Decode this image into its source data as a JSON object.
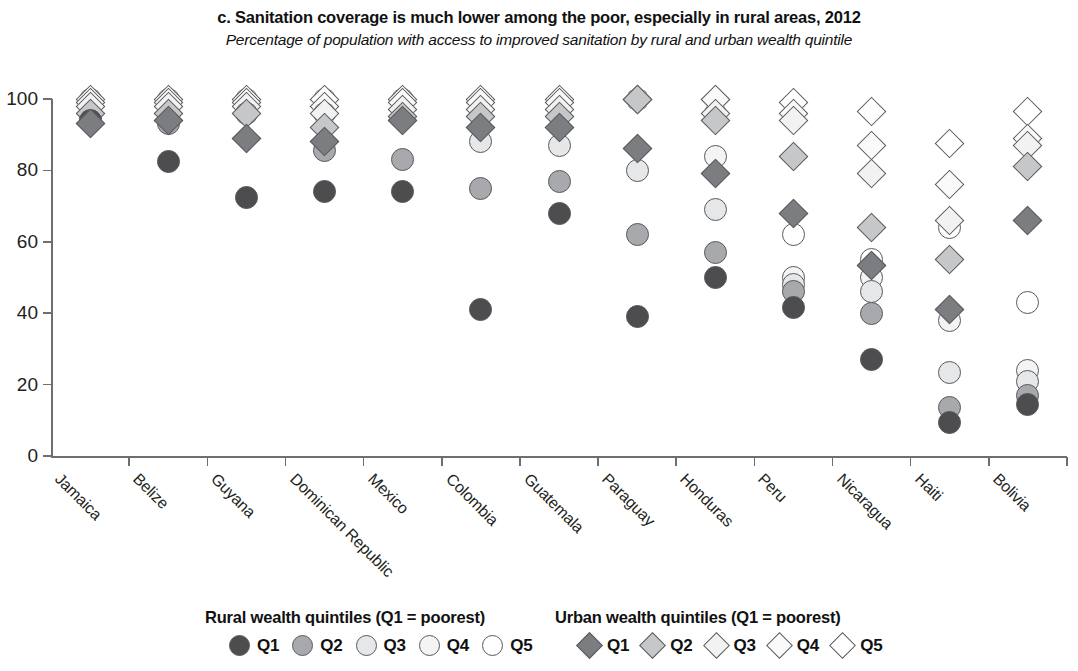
{
  "header": {
    "title": "c. Sanitation coverage is much lower among the poor, especially in rural areas, 2012",
    "subtitle": "Percentage of population with access to improved sanitation by rural and urban wealth quintile"
  },
  "legend": {
    "rural": {
      "heading": "Rural wealth quintiles (Q1 = poorest)",
      "items": [
        {
          "label": "Q1",
          "shape": "circle",
          "fill": "#4d4d4f"
        },
        {
          "label": "Q2",
          "shape": "circle",
          "fill": "#a7a9ac"
        },
        {
          "label": "Q3",
          "shape": "circle",
          "fill": "#e6e7e8"
        },
        {
          "label": "Q4",
          "shape": "circle",
          "fill": "#f4f4f5"
        },
        {
          "label": "Q5",
          "shape": "circle",
          "fill": "#ffffff"
        }
      ]
    },
    "urban": {
      "heading": "Urban wealth quintiles (Q1 = poorest)",
      "items": [
        {
          "label": "Q1",
          "shape": "diamond",
          "fill": "#7c7d80"
        },
        {
          "label": "Q2",
          "shape": "diamond",
          "fill": "#c6c7c9"
        },
        {
          "label": "Q3",
          "shape": "diamond",
          "fill": "#f2f2f3"
        },
        {
          "label": "Q4",
          "shape": "diamond",
          "fill": "#fafafa"
        },
        {
          "label": "Q5",
          "shape": "diamond",
          "fill": "#ffffff"
        }
      ]
    }
  },
  "chart_data": {
    "type": "scatter",
    "title": "c. Sanitation coverage is much lower among the poor, especially in rural areas, 2012",
    "subtitle": "Percentage of population with access to improved sanitation by rural and urban wealth quintile",
    "xlabel": "",
    "ylabel": "",
    "ylim": [
      0,
      100
    ],
    "yticks": [
      0,
      20,
      40,
      60,
      80,
      100
    ],
    "grid": false,
    "legend_position": "bottom",
    "categories": [
      "Jamaica",
      "Belize",
      "Guyana",
      "Dominican Republic",
      "Mexico",
      "Colombia",
      "Guatemala",
      "Paraguay",
      "Honduras",
      "Peru",
      "Nicaragua",
      "Haiti",
      "Bolivia"
    ],
    "series": [
      {
        "name": "Rural Q1",
        "shape": "circle",
        "fill": "#4d4d4f",
        "values": [
          94,
          82.5,
          72.5,
          74,
          74,
          41,
          68,
          39,
          50,
          41.5,
          27,
          9.5,
          14.5
        ]
      },
      {
        "name": "Rural Q2",
        "shape": "circle",
        "fill": "#a7a9ac",
        "values": [
          95,
          93,
          96,
          85.5,
          83,
          75,
          77,
          62,
          57,
          46,
          40,
          13.5,
          17
        ]
      },
      {
        "name": "Rural Q3",
        "shape": "circle",
        "fill": "#e6e7e8",
        "values": [
          96,
          96,
          97,
          96,
          95,
          88,
          87,
          80,
          69,
          48,
          46,
          23.5,
          21
        ]
      },
      {
        "name": "Rural Q4",
        "shape": "circle",
        "fill": "#f4f4f5",
        "values": [
          98,
          98,
          98,
          97,
          97,
          96,
          96,
          100,
          84,
          50,
          50,
          38,
          24
        ]
      },
      {
        "name": "Rural Q5",
        "shape": "circle",
        "fill": "#ffffff",
        "values": [
          100,
          100,
          100,
          100,
          100,
          99,
          99,
          100,
          96,
          62,
          55,
          64,
          43
        ]
      },
      {
        "name": "Urban Q1",
        "shape": "diamond",
        "fill": "#7c7d80",
        "values": [
          93,
          94,
          89,
          88,
          94,
          92,
          92,
          86,
          79,
          68,
          53.5,
          41,
          66
        ]
      },
      {
        "name": "Urban Q2",
        "shape": "diamond",
        "fill": "#c6c7c9",
        "values": [
          96,
          96,
          96,
          92,
          95,
          95,
          95,
          100,
          94,
          84,
          64,
          55,
          81
        ]
      },
      {
        "name": "Urban Q3",
        "shape": "diamond",
        "fill": "#f2f2f3",
        "values": [
          98,
          98,
          98,
          96,
          97,
          97,
          97,
          100,
          96,
          94,
          79,
          66,
          87
        ]
      },
      {
        "name": "Urban Q4",
        "shape": "diamond",
        "fill": "#fafafa",
        "values": [
          99,
          99,
          99,
          98,
          99,
          99,
          99,
          100,
          100,
          96,
          87,
          76,
          89
        ]
      },
      {
        "name": "Urban Q5",
        "shape": "diamond",
        "fill": "#ffffff",
        "values": [
          100,
          100,
          100,
          100,
          100,
          100,
          100,
          100,
          100,
          99,
          96.5,
          87.5,
          96.5
        ]
      }
    ]
  },
  "axis": {
    "y_tick_labels": [
      "100",
      "80",
      "60",
      "40",
      "20",
      "0"
    ]
  }
}
